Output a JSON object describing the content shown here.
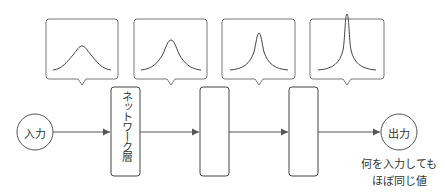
{
  "diagram": {
    "input": {
      "label": "入力"
    },
    "output": {
      "label": "出力"
    },
    "layers": [
      {
        "label": "ネットワーク層"
      },
      {
        "label": ""
      },
      {
        "label": ""
      }
    ],
    "callouts": [
      {
        "shape": "wide-gaussian"
      },
      {
        "shape": "narrower-peak"
      },
      {
        "shape": "sharp-peak"
      },
      {
        "shape": "spike-peak"
      }
    ],
    "caption": {
      "line1": "何を入力しても",
      "line2": "ほぼ同じ値"
    },
    "colors": {
      "stroke": "#555555",
      "text": "#333333",
      "background": "#ffffff"
    }
  }
}
